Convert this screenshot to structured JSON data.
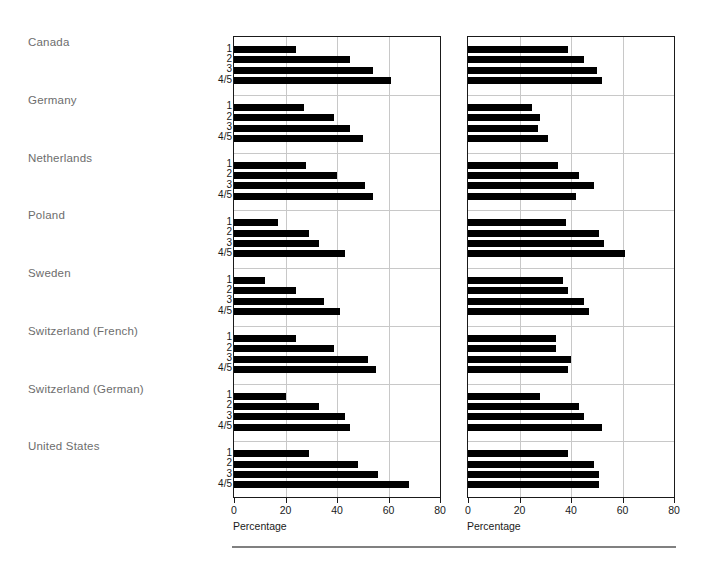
{
  "chart_data": {
    "type": "bar",
    "orientation": "horizontal",
    "title": "",
    "panels": [
      {
        "name": "left-panel",
        "xlabel": "Percentage",
        "ylabel": "",
        "xlim": [
          0,
          80
        ],
        "xticks": [
          0,
          20,
          40,
          60,
          80
        ],
        "xtick_labels": [
          "0",
          "20",
          "40",
          "60",
          "80"
        ],
        "grid": true,
        "legend": "none",
        "categories": [
          "1",
          "2",
          "3",
          "4/5"
        ],
        "groups": [
          {
            "label": "Canada",
            "values": [
              24,
              45,
              54,
              61
            ]
          },
          {
            "label": "Germany",
            "values": [
              27,
              39,
              45,
              50
            ]
          },
          {
            "label": "Netherlands",
            "values": [
              28,
              40,
              51,
              54
            ]
          },
          {
            "label": "Poland",
            "values": [
              17,
              29,
              33,
              43
            ]
          },
          {
            "label": "Sweden",
            "values": [
              12,
              24,
              35,
              41
            ]
          },
          {
            "label": "Switzerland (French)",
            "values": [
              24,
              39,
              52,
              55
            ]
          },
          {
            "label": "Switzerland (German)",
            "values": [
              20,
              33,
              43,
              45
            ]
          },
          {
            "label": "United States",
            "values": [
              29,
              48,
              56,
              68
            ]
          }
        ]
      },
      {
        "name": "right-panel",
        "xlabel": "Percentage",
        "ylabel": "",
        "xlim": [
          0,
          80
        ],
        "xticks": [
          0,
          20,
          40,
          60,
          80
        ],
        "xtick_labels": [
          "0",
          "20",
          "40",
          "60",
          "80"
        ],
        "grid": true,
        "legend": "none",
        "categories": [
          "1",
          "2",
          "3",
          "4/5"
        ],
        "groups": [
          {
            "label": "Canada",
            "values": [
              39,
              45,
              50,
              52
            ]
          },
          {
            "label": "Germany",
            "values": [
              25,
              28,
              27,
              31
            ]
          },
          {
            "label": "Netherlands",
            "values": [
              35,
              43,
              49,
              42
            ]
          },
          {
            "label": "Poland",
            "values": [
              38,
              51,
              53,
              61
            ]
          },
          {
            "label": "Sweden",
            "values": [
              37,
              39,
              45,
              47
            ]
          },
          {
            "label": "Switzerland (French)",
            "values": [
              34,
              34,
              40,
              39
            ]
          },
          {
            "label": "Switzerland (German)",
            "values": [
              28,
              43,
              45,
              52
            ]
          },
          {
            "label": "United States",
            "values": [
              39,
              49,
              51,
              51
            ]
          }
        ]
      }
    ]
  },
  "axis": {
    "left": {
      "xlabel": "Percentage",
      "ticks": [
        "0",
        "20",
        "40",
        "60",
        "80"
      ]
    },
    "right": {
      "xlabel": "Percentage",
      "ticks": [
        "0",
        "20",
        "40",
        "60",
        "80"
      ]
    }
  },
  "colors": {
    "bar": "#000000",
    "grid": "#c8c8c8",
    "axis": "#1a1a1a",
    "country_label": "#6d6d6d",
    "background": "#ffffff",
    "footer_rule": "#808080"
  }
}
